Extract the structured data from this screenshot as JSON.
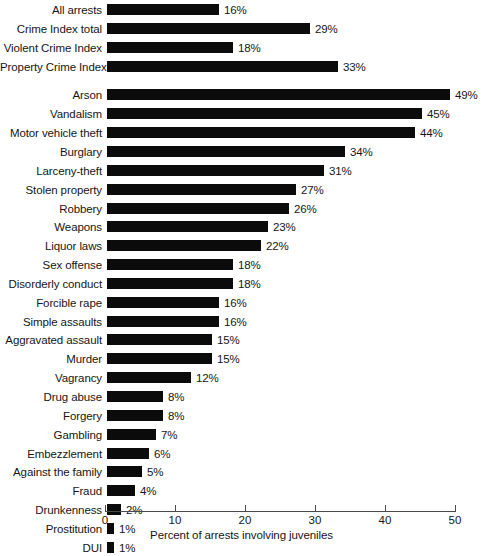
{
  "chart_data": {
    "type": "bar",
    "orientation": "horizontal",
    "title": "",
    "subtitle": "",
    "xlabel": "Percent of arrests involving juveniles",
    "ylabel": "",
    "xlim": [
      0,
      50
    ],
    "xticks": [
      0,
      10,
      20,
      30,
      40,
      50
    ],
    "xtick_labels": [
      "0",
      "10",
      "20",
      "30",
      "40",
      "50"
    ],
    "grid": false,
    "legend": null,
    "value_label_suffix": "%",
    "bar_color": "#0b0b0b",
    "categories": [
      "All arrests",
      "Crime Index total",
      "Violent Crime Index",
      "Property Crime Index",
      "Arson",
      "Vandalism",
      "Motor vehicle theft",
      "Burglary",
      "Larceny-theft",
      "Stolen property",
      "Robbery",
      "Weapons",
      "Liquor laws",
      "Sex offense",
      "Disorderly conduct",
      "Forcible rape",
      "Simple assaults",
      "Aggravated assault",
      "Murder",
      "Vagrancy",
      "Drug abuse",
      "Forgery",
      "Gambling",
      "Embezzlement",
      "Against the family",
      "Fraud",
      "Drunkenness",
      "Prostitution",
      "DUI"
    ],
    "values": [
      16,
      29,
      18,
      33,
      49,
      45,
      44,
      34,
      31,
      27,
      26,
      23,
      22,
      18,
      18,
      16,
      16,
      15,
      15,
      12,
      8,
      8,
      7,
      6,
      5,
      4,
      2,
      1,
      1
    ],
    "value_labels": [
      "16%",
      "29%",
      "18%",
      "33%",
      "49%",
      "45%",
      "44%",
      "34%",
      "31%",
      "27%",
      "26%",
      "23%",
      "22%",
      "18%",
      "18%",
      "16%",
      "16%",
      "15%",
      "15%",
      "12%",
      "8%",
      "8%",
      "7%",
      "6%",
      "5%",
      "4%",
      "2%",
      "1%",
      "1%"
    ],
    "group_break_after_index": 3
  }
}
